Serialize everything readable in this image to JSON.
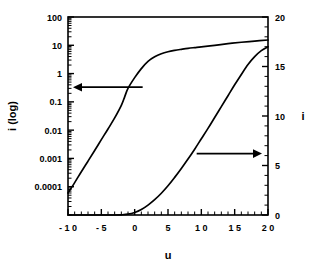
{
  "chart_data": {
    "type": "line",
    "title": "",
    "xlabel": "u",
    "ylabel_left": "i (log)",
    "ylabel_right": "i",
    "grid": false,
    "legend": "none",
    "xlim": [
      -10,
      20
    ],
    "xticks": [
      -10,
      -5,
      0,
      5,
      10,
      15,
      20
    ],
    "xtick_labels": [
      "- 1 0",
      "- 5",
      "0",
      "5",
      "1 0",
      "1 5",
      "2 0"
    ],
    "x_minor_step": 1,
    "left_axis": {
      "label": "i (log)",
      "scale": "log",
      "ylim": [
        1e-05,
        100
      ],
      "yticks": [
        100,
        10,
        1,
        0.1,
        0.01,
        0.001,
        0.0001
      ],
      "ytick_labels": [
        "100",
        "10",
        "1",
        "0.1",
        "0.01",
        "0.001",
        "0.0001"
      ],
      "minor_ticks": "decade-subdivisions"
    },
    "right_axis": {
      "label": "i",
      "scale": "linear",
      "ylim": [
        0,
        20
      ],
      "yticks": [
        0,
        5,
        10,
        15,
        20
      ],
      "ytick_labels": [
        "0",
        "5",
        "10",
        "15",
        "20"
      ],
      "minor_step": 1
    },
    "annotations": [
      {
        "name": "left-arrow",
        "text": "",
        "points_to": "left-axis",
        "x": 1.2,
        "y_log": 0.33
      },
      {
        "name": "right-arrow",
        "text": "",
        "points_to": "right-axis",
        "x": 13.5,
        "y_linear": 6.2
      }
    ],
    "series": [
      {
        "name": "current-log",
        "axis": "left",
        "scale": "log",
        "x": [
          -10,
          -9,
          -8,
          -7,
          -6,
          -5,
          -4,
          -3,
          -2,
          -1.5,
          -1,
          0,
          1,
          2,
          3,
          4,
          5,
          6,
          7,
          8,
          9,
          10,
          12,
          14,
          16,
          18,
          20
        ],
        "values": [
          6e-05,
          0.00014,
          0.00034,
          0.0008,
          0.0019,
          0.0046,
          0.011,
          0.027,
          0.075,
          0.15,
          0.3,
          0.72,
          1.5,
          2.7,
          3.9,
          5.0,
          5.9,
          6.6,
          7.2,
          7.8,
          8.3,
          8.8,
          10.0,
          11.4,
          12.8,
          14.1,
          15.4
        ]
      },
      {
        "name": "current-linear",
        "axis": "right",
        "scale": "linear",
        "x": [
          -10,
          -8,
          -6,
          -4,
          -3,
          -2,
          -1,
          0,
          1,
          2,
          3,
          4,
          5,
          6,
          7,
          8,
          9,
          10,
          11,
          12,
          13,
          14,
          15,
          16,
          17,
          18,
          19,
          20
        ],
        "values": [
          0,
          0,
          0,
          0,
          0,
          0.02,
          0.08,
          0.25,
          0.55,
          1.0,
          1.55,
          2.2,
          2.95,
          3.8,
          4.7,
          5.65,
          6.65,
          7.7,
          8.75,
          9.85,
          10.95,
          12.05,
          13.15,
          14.2,
          15.2,
          16.0,
          16.6,
          17.0
        ]
      }
    ]
  },
  "colors": {
    "background": "#ffffff",
    "ink": "#000000"
  }
}
